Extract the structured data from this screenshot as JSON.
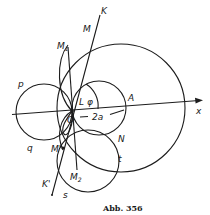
{
  "figure": {
    "caption": "Abb. 356",
    "labels": {
      "K": "K",
      "M": "M",
      "M1": "M",
      "M1_sub": "1",
      "P": "p",
      "L": "L",
      "phi": "φ",
      "A": "A",
      "O": "O",
      "two_a": "2a",
      "x": "x",
      "q": "q",
      "N": "N",
      "M_prime": "M'",
      "t": "t",
      "M2": "M",
      "M2_sub": "2",
      "K_prime": "K'",
      "s": "s"
    },
    "colors": {
      "ink": "#1c1c1c",
      "paper": "#ffffff"
    }
  }
}
